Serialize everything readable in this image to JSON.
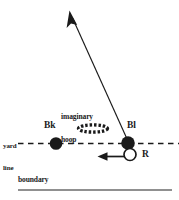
{
  "diagram": {
    "background_color": "#ffffff",
    "stroke_color": "#1a1a1a",
    "boundary_color": "#6b6b6b",
    "labels": {
      "bk": "Bk",
      "bl": "Bl",
      "r": "R",
      "yard_line_1": "yard",
      "yard_line_2": "line",
      "hoop_1": "imaginary",
      "hoop_2": "hoop",
      "boundary": "boundary"
    },
    "markers": {
      "bk_player": "filled-circle",
      "bl_player": "filled-circle",
      "r_player": "open-circle",
      "hoop": "dashed-ellipse"
    },
    "arrows": {
      "long_arrow": "long-arrow-up-left",
      "short_arrow": "short-arrow-left"
    }
  }
}
